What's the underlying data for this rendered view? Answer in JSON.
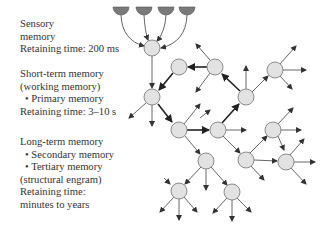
{
  "labels": {
    "sensory": {
      "title_line1": "Sensory",
      "title_line2": "memory",
      "retaining": "Retaining time: 200 ms"
    },
    "short_term": {
      "title_line1": "Short-term memory",
      "title_line2": "(working memory)",
      "bullet1": "• Primary memory",
      "retaining": "Retaining time: 3–10 s"
    },
    "long_term": {
      "title": "Long-term memory",
      "bullet1": "• Secondary memory",
      "bullet2": "• Tertiary memory",
      "bullet2_cont": "(structural engram)",
      "retaining_line1": "Retaining time:",
      "retaining_line2": "minutes to years"
    }
  },
  "colors": {
    "node_fill": "#e2e2e2",
    "node_stroke": "#808080",
    "receptor_fill": "#7a7a7a",
    "edge": "#555555",
    "edge_bold": "#222222",
    "text": "#333333"
  },
  "diagram": {
    "receptors": [
      {
        "cx": 121,
        "cy": 14
      },
      {
        "cx": 144,
        "cy": 14
      },
      {
        "cx": 166,
        "cy": 14
      },
      {
        "cx": 187,
        "cy": 14
      }
    ],
    "nodes": [
      {
        "id": "A",
        "x": 152,
        "y": 48
      },
      {
        "id": "B",
        "x": 152,
        "y": 97
      },
      {
        "id": "C",
        "x": 179,
        "y": 67
      },
      {
        "id": "D",
        "x": 215,
        "y": 67
      },
      {
        "id": "E",
        "x": 246,
        "y": 97
      },
      {
        "id": "F",
        "x": 179,
        "y": 130
      },
      {
        "id": "G",
        "x": 218,
        "y": 130
      },
      {
        "id": "H",
        "x": 206,
        "y": 161
      },
      {
        "id": "I",
        "x": 246,
        "y": 160
      },
      {
        "id": "K",
        "x": 275,
        "y": 70
      },
      {
        "id": "L",
        "x": 273,
        "y": 130
      },
      {
        "id": "M",
        "x": 286,
        "y": 162
      },
      {
        "id": "N",
        "x": 179,
        "y": 191
      },
      {
        "id": "O",
        "x": 232,
        "y": 192
      }
    ]
  }
}
